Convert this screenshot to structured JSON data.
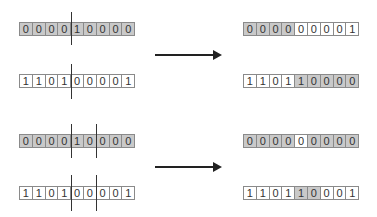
{
  "panels": [
    {
      "name": "top",
      "input_a": {
        "bits": [
          "0",
          "0",
          "0",
          "0",
          "1",
          "0",
          "0",
          "0",
          "0"
        ],
        "shaded": [
          0,
          1,
          2,
          3,
          4,
          5,
          6,
          7,
          8
        ]
      },
      "input_b": {
        "bits": [
          "1",
          "1",
          "0",
          "1",
          "0",
          "0",
          "0",
          "0",
          "1"
        ],
        "shaded": []
      },
      "cut_points": [
        4
      ],
      "output_a": {
        "bits": [
          "0",
          "0",
          "0",
          "0",
          "0",
          "0",
          "0",
          "0",
          "1"
        ],
        "shaded": [
          0,
          1,
          2,
          3
        ]
      },
      "output_b": {
        "bits": [
          "1",
          "1",
          "0",
          "1",
          "1",
          "0",
          "0",
          "0",
          "0"
        ],
        "shaded": [
          4,
          5,
          6,
          7,
          8
        ]
      }
    },
    {
      "name": "bottom",
      "input_a": {
        "bits": [
          "0",
          "0",
          "0",
          "0",
          "1",
          "0",
          "0",
          "0",
          "0"
        ],
        "shaded": [
          0,
          1,
          2,
          3,
          4,
          5,
          6,
          7,
          8
        ]
      },
      "input_b": {
        "bits": [
          "1",
          "1",
          "0",
          "1",
          "0",
          "0",
          "0",
          "0",
          "1"
        ],
        "shaded": []
      },
      "cut_points": [
        4,
        6
      ],
      "output_a": {
        "bits": [
          "0",
          "0",
          "0",
          "0",
          "0",
          "0",
          "0",
          "0",
          "0"
        ],
        "shaded": [
          0,
          1,
          2,
          3,
          5,
          6,
          7,
          8
        ]
      },
      "output_b": {
        "bits": [
          "1",
          "1",
          "0",
          "1",
          "1",
          "0",
          "0",
          "0",
          "1"
        ],
        "shaded": [
          4,
          5
        ]
      }
    }
  ],
  "colors": {
    "shade": "#c9c9c9",
    "border": "#8a8a8a",
    "line": "#333333"
  }
}
